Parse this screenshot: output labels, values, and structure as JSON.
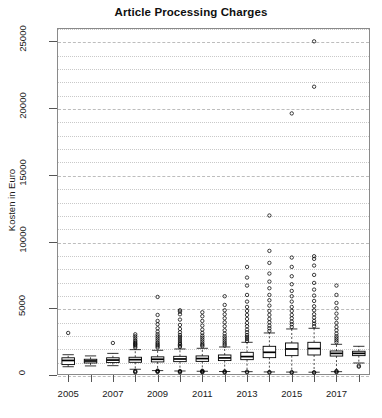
{
  "chart_data": {
    "type": "boxplot",
    "title": "Article Processing Charges",
    "xlabel": "",
    "ylabel": "Kosten in Euro",
    "ylim": [
      0,
      26000
    ],
    "ytick_values": [
      0,
      5000,
      10000,
      15000,
      20000,
      25000
    ],
    "ytick_labels": [
      "0",
      "5000",
      "10000",
      "15000",
      "20000",
      "25000"
    ],
    "grid": "horizontal dotted minor every 1000, dashed major every 5000",
    "legend": "none",
    "categories": [
      2005,
      2006,
      2007,
      2008,
      2009,
      2010,
      2011,
      2012,
      2013,
      2014,
      2015,
      2016,
      2017,
      2018
    ],
    "xtick_labels": [
      "2005",
      "",
      "2007",
      "",
      "2009",
      "",
      "2011",
      "",
      "2013",
      "",
      "2015",
      "",
      "2017",
      ""
    ],
    "boxes": [
      {
        "year": 2005,
        "low": 620,
        "q1": 780,
        "median": 1090,
        "q3": 1290,
        "high": 1520,
        "outliers": [
          3150
        ]
      },
      {
        "year": 2006,
        "low": 680,
        "q1": 900,
        "median": 1050,
        "q3": 1180,
        "high": 1430,
        "outliers": []
      },
      {
        "year": 2007,
        "low": 700,
        "q1": 930,
        "median": 1120,
        "q3": 1290,
        "high": 1620,
        "outliers": [
          2400
        ]
      },
      {
        "year": 2008,
        "low": 430,
        "q1": 950,
        "median": 1150,
        "q3": 1330,
        "high": 1900,
        "outliers": [
          2050,
          2150,
          2250,
          2320,
          2400,
          2500,
          2600,
          2750,
          2900,
          3050,
          200,
          250,
          300
        ]
      },
      {
        "year": 2009,
        "low": 330,
        "q1": 980,
        "median": 1180,
        "q3": 1360,
        "high": 1850,
        "outliers": [
          2050,
          2150,
          2250,
          2350,
          2450,
          2600,
          2750,
          2900,
          3050,
          3250,
          3500,
          3800,
          4050,
          4500,
          5850,
          230,
          260,
          300,
          330
        ]
      },
      {
        "year": 2010,
        "low": 300,
        "q1": 1000,
        "median": 1200,
        "q3": 1400,
        "high": 1950,
        "outliers": [
          2100,
          2200,
          2300,
          2400,
          2550,
          2700,
          2850,
          3000,
          3200,
          3450,
          3750,
          4150,
          4550,
          4750,
          4850,
          200,
          250,
          300
        ]
      },
      {
        "year": 2011,
        "low": 280,
        "q1": 1020,
        "median": 1230,
        "q3": 1430,
        "high": 2000,
        "outliers": [
          2150,
          2250,
          2350,
          2500,
          2650,
          2800,
          2950,
          3150,
          3400,
          3700,
          4050,
          4400,
          4700,
          200,
          240,
          280,
          320
        ]
      },
      {
        "year": 2012,
        "low": 260,
        "q1": 1080,
        "median": 1280,
        "q3": 1500,
        "high": 2100,
        "outliers": [
          2200,
          2320,
          2450,
          2600,
          2750,
          2900,
          3100,
          3350,
          3650,
          3950,
          4250,
          4550,
          4850,
          5250,
          5900,
          180,
          230,
          280
        ]
      },
      {
        "year": 2013,
        "low": 250,
        "q1": 1150,
        "median": 1380,
        "q3": 1700,
        "high": 2450,
        "outliers": [
          2550,
          2700,
          2850,
          3000,
          3200,
          3400,
          3650,
          3900,
          4200,
          4500,
          4800,
          5100,
          5500,
          6000,
          6700,
          7300,
          8100,
          200,
          250
        ]
      },
      {
        "year": 2014,
        "low": 230,
        "q1": 1300,
        "median": 1700,
        "q3": 2150,
        "high": 3150,
        "outliers": [
          3300,
          3500,
          3700,
          3950,
          4200,
          4500,
          4800,
          5200,
          5600,
          6000,
          6500,
          7000,
          7600,
          8400,
          9300,
          11950,
          180,
          230
        ]
      },
      {
        "year": 2015,
        "low": 220,
        "q1": 1450,
        "median": 1950,
        "q3": 2400,
        "high": 3450,
        "outliers": [
          3600,
          3800,
          4000,
          4250,
          4500,
          4800,
          5100,
          5500,
          5900,
          6300,
          6800,
          7400,
          8100,
          8800,
          19600,
          170,
          220
        ]
      },
      {
        "year": 2016,
        "low": 210,
        "q1": 1500,
        "median": 1980,
        "q3": 2450,
        "high": 3500,
        "outliers": [
          3650,
          3850,
          4050,
          4300,
          4550,
          4850,
          5150,
          5550,
          5950,
          6400,
          6900,
          7500,
          8200,
          8700,
          8900,
          21600,
          25000,
          170,
          210
        ]
      },
      {
        "year": 2017,
        "low": 250,
        "q1": 1420,
        "median": 1620,
        "q3": 1800,
        "high": 2300,
        "outliers": [
          2450,
          2600,
          2750,
          2900,
          3100,
          3350,
          3600,
          3900,
          4250,
          4600,
          5000,
          5400,
          6000,
          6700,
          200,
          250,
          300
        ]
      },
      {
        "year": 2018,
        "low": 900,
        "q1": 1450,
        "median": 1620,
        "q3": 1780,
        "high": 2150,
        "outliers": [
          700,
          620
        ]
      }
    ]
  },
  "axes": {
    "y_label": "Kosten in Euro",
    "title": "Article Processing Charges"
  }
}
